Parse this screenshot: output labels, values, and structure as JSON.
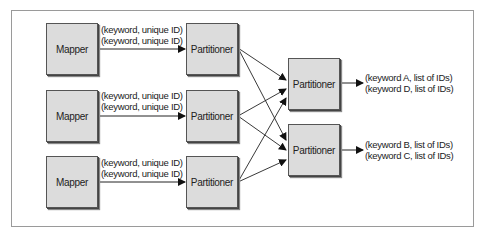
{
  "diagram": {
    "mappers": [
      {
        "label": "Mapper"
      },
      {
        "label": "Mapper"
      },
      {
        "label": "Mapper"
      }
    ],
    "partitioners_stage1": [
      {
        "label": "Partitioner"
      },
      {
        "label": "Partitioner"
      },
      {
        "label": "Partitioner"
      }
    ],
    "partitioners_stage2": [
      {
        "label": "Partitioner"
      },
      {
        "label": "Partitioner"
      }
    ],
    "mapper_edges": [
      {
        "line1": "(keyword, unique ID)",
        "line2": "(keyword, unique ID)"
      },
      {
        "line1": "(keyword, unique ID)",
        "line2": "(keyword, unique ID)"
      },
      {
        "line1": "(keyword, unique ID)",
        "line2": "(keyword, unique ID)"
      }
    ],
    "outputs": [
      {
        "line1": "(keyword A, list of IDs)",
        "line2": "(keyword D, list of IDs)"
      },
      {
        "line1": "(keyword B, list of IDs)",
        "line2": "(keyword C, list of IDs)"
      }
    ],
    "colors": {
      "box_fill": "#dcdcdc",
      "box_border": "#555555",
      "line": "#222222",
      "frame": "#9a9a9a"
    }
  }
}
